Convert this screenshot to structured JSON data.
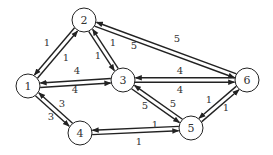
{
  "diagram": {
    "type": "directed-weighted-graph",
    "nodes": [
      {
        "id": "1",
        "label": "1",
        "x": 28,
        "y": 86
      },
      {
        "id": "2",
        "label": "2",
        "x": 84,
        "y": 20
      },
      {
        "id": "3",
        "label": "3",
        "x": 123,
        "y": 80
      },
      {
        "id": "4",
        "label": "4",
        "x": 80,
        "y": 133
      },
      {
        "id": "5",
        "label": "5",
        "x": 191,
        "y": 128
      },
      {
        "id": "6",
        "label": "6",
        "x": 247,
        "y": 80
      }
    ],
    "edges": [
      {
        "from": "1",
        "to": "2",
        "weight": "1",
        "lx": 47,
        "ly": 42
      },
      {
        "from": "2",
        "to": "1",
        "weight": "1",
        "lx": 66,
        "ly": 57
      },
      {
        "from": "2",
        "to": "3",
        "weight": "1",
        "lx": 113,
        "ly": 42
      },
      {
        "from": "3",
        "to": "2",
        "weight": "1",
        "lx": 98,
        "ly": 55
      },
      {
        "from": "2",
        "to": "6",
        "weight": "5",
        "lx": 177,
        "ly": 38
      },
      {
        "from": "6",
        "to": "2",
        "weight": "5",
        "lx": 134,
        "ly": 45
      },
      {
        "from": "1",
        "to": "3",
        "weight": "4",
        "lx": 77,
        "ly": 70
      },
      {
        "from": "3",
        "to": "1",
        "weight": "4",
        "lx": 75,
        "ly": 89
      },
      {
        "from": "3",
        "to": "6",
        "weight": "4",
        "lx": 180,
        "ly": 70
      },
      {
        "from": "6",
        "to": "3",
        "weight": "4",
        "lx": 180,
        "ly": 89
      },
      {
        "from": "1",
        "to": "4",
        "weight": "3",
        "lx": 62,
        "ly": 103
      },
      {
        "from": "4",
        "to": "1",
        "weight": "3",
        "lx": 51,
        "ly": 116
      },
      {
        "from": "3",
        "to": "5",
        "weight": "5",
        "lx": 173,
        "ly": 103
      },
      {
        "from": "5",
        "to": "3",
        "weight": "5",
        "lx": 145,
        "ly": 105
      },
      {
        "from": "5",
        "to": "6",
        "weight": "1",
        "lx": 209,
        "ly": 99
      },
      {
        "from": "6",
        "to": "5",
        "weight": "1",
        "lx": 226,
        "ly": 107
      },
      {
        "from": "4",
        "to": "5",
        "weight": "1",
        "lx": 155,
        "ly": 124
      },
      {
        "from": "5",
        "to": "4",
        "weight": "1",
        "lx": 139,
        "ly": 141
      }
    ]
  }
}
